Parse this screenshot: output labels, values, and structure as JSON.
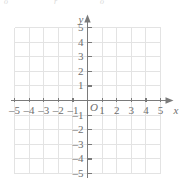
{
  "chart_data": {
    "type": "scatter",
    "title": "",
    "subtitle": "",
    "xlabel": "x",
    "ylabel": "y",
    "origin_label": "O",
    "xlim": [
      -5,
      5
    ],
    "ylim": [
      -5,
      5
    ],
    "grid": true,
    "legend": null,
    "series": [],
    "values": [],
    "x": [],
    "annotations": [],
    "x_ticks": [
      {
        "value": -5,
        "label": "–5"
      },
      {
        "value": -4,
        "label": "–4"
      },
      {
        "value": -3,
        "label": "–3"
      },
      {
        "value": -2,
        "label": "–2"
      },
      {
        "value": -1,
        "label": "–1"
      },
      {
        "value": 1,
        "label": "1"
      },
      {
        "value": 2,
        "label": "2"
      },
      {
        "value": 3,
        "label": "3"
      },
      {
        "value": 4,
        "label": "4"
      },
      {
        "value": 5,
        "label": "5"
      }
    ],
    "y_ticks": [
      {
        "value": 5,
        "label": "5"
      },
      {
        "value": 4,
        "label": "4"
      },
      {
        "value": 3,
        "label": "3"
      },
      {
        "value": 2,
        "label": "2"
      },
      {
        "value": 1,
        "label": "1"
      },
      {
        "value": -1,
        "label": "–1"
      },
      {
        "value": -2,
        "label": "–2"
      },
      {
        "value": -3,
        "label": "–3"
      },
      {
        "value": -4,
        "label": "–4"
      },
      {
        "value": -5,
        "label": "–5"
      }
    ],
    "colors": {
      "background": "#ffffff",
      "grid": "#e3e3e3",
      "axis": "#7a7a7a",
      "text": "#6e6e6e"
    }
  },
  "artifact": {
    "fragment_left": "o",
    "fragment_mid": "r",
    "fragment_right": "o"
  }
}
